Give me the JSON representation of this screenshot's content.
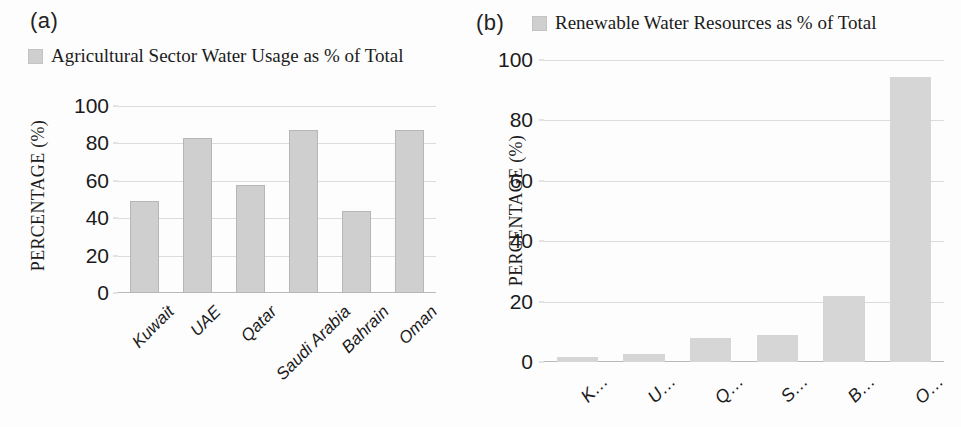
{
  "figure": {
    "panel_a_tag": "(a)",
    "panel_b_tag": "(b)"
  },
  "chart_data": [
    {
      "id": "panel-a",
      "type": "bar",
      "title": "",
      "legend": [
        "Agricultural Sector Water Usage as % of Total"
      ],
      "legend_position": "top-left",
      "series_name": "Agricultural Sector Water Usage as % of Total",
      "categories": [
        "Kuwait",
        "UAE",
        "Qatar",
        "Saudi Arabia",
        "Bahrain",
        "Oman"
      ],
      "values": [
        49,
        83,
        58,
        87,
        44,
        87
      ],
      "xlabel": "",
      "ylabel": "PERCENTAGE (%)",
      "ylim": [
        0,
        100
      ],
      "yticks": [
        0,
        20,
        40,
        60,
        80,
        100
      ],
      "ytick_labels": [
        "0",
        "20",
        "40",
        "60",
        "80",
        "100"
      ],
      "grid": true,
      "bar_color": "#cfcfcf"
    },
    {
      "id": "panel-b",
      "type": "bar",
      "title": "",
      "legend": [
        "Renewable Water Resources as % of Total"
      ],
      "legend_position": "top-center",
      "series_name": "Renewable Water Resources as % of Total",
      "categories": [
        "K…",
        "U…",
        "Q…",
        "S…",
        "B…",
        "O…"
      ],
      "categories_full": [
        "Kuwait",
        "UAE",
        "Qatar",
        "Saudi Arabia",
        "Bahrain",
        "Oman"
      ],
      "values": [
        1.5,
        2.5,
        8,
        9,
        22,
        94.5
      ],
      "xlabel": "",
      "ylabel": "PERCENTAGE (%)",
      "ylim": [
        0,
        100
      ],
      "yticks": [
        0,
        20,
        40,
        60,
        80,
        100
      ],
      "ytick_labels": [
        "0",
        "20",
        "40",
        "60",
        "80",
        "100"
      ],
      "grid": true,
      "bar_color": "#d6d6d6"
    }
  ]
}
